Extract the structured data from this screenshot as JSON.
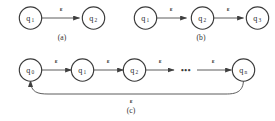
{
  "figure": {
    "type": "automata-diagram",
    "background_color": "#ffffff",
    "stroke_color": "#3a3a3a",
    "text_color": "#2e2e2e",
    "epsilon_symbol": "ε",
    "ellipsis_symbol": "•••",
    "panels": [
      {
        "id": "a",
        "caption": "(a)",
        "states": [
          {
            "name": "q1",
            "base": "q",
            "sub": "1"
          },
          {
            "name": "q2",
            "base": "q",
            "sub": "2"
          }
        ],
        "transitions": [
          {
            "from": "q1",
            "to": "q2",
            "label": "ε"
          }
        ],
        "loop": null
      },
      {
        "id": "b",
        "caption": "(b)",
        "states": [
          {
            "name": "q1",
            "base": "q",
            "sub": "1"
          },
          {
            "name": "q2",
            "base": "q",
            "sub": "2"
          },
          {
            "name": "q3",
            "base": "q",
            "sub": "3"
          }
        ],
        "transitions": [
          {
            "from": "q1",
            "to": "q2",
            "label": "ε"
          },
          {
            "from": "q2",
            "to": "q3",
            "label": "ε"
          }
        ],
        "loop": null
      },
      {
        "id": "c",
        "caption": "(c)",
        "states": [
          {
            "name": "q0",
            "base": "q",
            "sub": "0"
          },
          {
            "name": "q1",
            "base": "q",
            "sub": "1"
          },
          {
            "name": "q2",
            "base": "q",
            "sub": "2"
          },
          {
            "name": "qn",
            "base": "q",
            "sub": "n"
          }
        ],
        "transitions": [
          {
            "from": "q0",
            "to": "q1",
            "label": "ε"
          },
          {
            "from": "q1",
            "to": "q2",
            "label": "ε"
          },
          {
            "from": "q2",
            "to": "dots",
            "label": "ε"
          },
          {
            "from": "dots",
            "to": "qn",
            "label": "ε"
          }
        ],
        "loop": {
          "from": "qn",
          "to": "q0",
          "label": "ε"
        }
      }
    ]
  },
  "labels": {
    "panel_a": {
      "state_1_base": "q",
      "state_1_sub": "1",
      "state_2_base": "q",
      "state_2_sub": "2",
      "eps_1": "ε",
      "caption": "(a)"
    },
    "panel_b": {
      "state_1_base": "q",
      "state_1_sub": "1",
      "state_2_base": "q",
      "state_2_sub": "2",
      "state_3_base": "q",
      "state_3_sub": "3",
      "eps_1": "ε",
      "eps_2": "ε",
      "caption": "(b)"
    },
    "panel_c": {
      "state_1_base": "q",
      "state_1_sub": "0",
      "state_2_base": "q",
      "state_2_sub": "1",
      "state_3_base": "q",
      "state_3_sub": "2",
      "state_4_base": "q",
      "state_4_sub": "n",
      "eps_1": "ε",
      "eps_2": "ε",
      "eps_3": "ε",
      "eps_4": "ε",
      "eps_loop": "ε",
      "dots": "•••",
      "caption": "(c)"
    }
  }
}
